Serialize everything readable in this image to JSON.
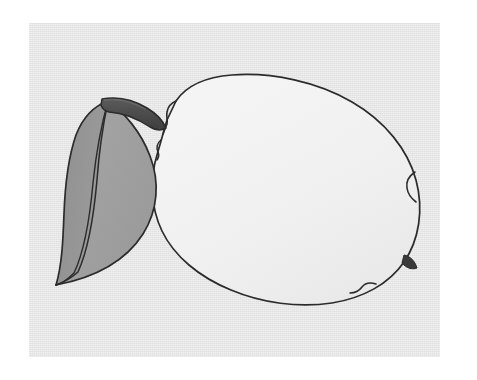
{
  "artwork": {
    "title": "Lemon with leaf",
    "subject": "lemon-fruit-line-drawing",
    "style": "clip-art line drawing, grayscale",
    "caption": ""
  },
  "canvas": {
    "page_background": "#ffffff",
    "card_background": "#e5e5e5",
    "card_left": 29,
    "card_top": 23,
    "card_width": 411,
    "card_height": 334
  },
  "palette": {
    "outline": "#2b2b2b",
    "fruit_fill": "#f1f1f1",
    "fruit_shade": "#ebebeb",
    "leaf_left_fill": "#959595",
    "leaf_right_fill": "#a2a2a2",
    "leaf_midrib": "#8e8e8e",
    "stem_fill": "#4d4d4d",
    "stem_highlight": "#6b6b6b",
    "blossom_nub": "#3a3a3a"
  },
  "elements": {
    "fruit": {
      "label": "lemon body",
      "bounds": {
        "x": 150,
        "y": 73,
        "width": 272,
        "height": 234
      }
    },
    "leaf": {
      "label": "leaf",
      "bounds": {
        "x": 51,
        "y": 100,
        "width": 115,
        "height": 186
      },
      "halves": [
        "leaf-left-half",
        "leaf-right-half"
      ],
      "midrib": "leaf-midrib-vein"
    },
    "stem": {
      "label": "stem",
      "bounds": {
        "x": 100,
        "y": 96,
        "width": 66,
        "height": 32
      }
    },
    "blossom_tip": {
      "label": "blossom end nub",
      "position": {
        "x": 414,
        "y": 267
      }
    }
  },
  "geometry": {
    "fruit_outline_path": "M 176,101 C 186,86 206,77 232,75 C 272,72 318,82 352,102 C 385,121 408,150 416,180 C 424,210 419,240 404,262 C 389,284 363,298 332,303 C 298,308 262,303 231,290 C 199,277 174,256 162,231 C 150,206 150,178 157,155 L 163,134 L 167,120 Z",
    "fruit_left_notch_path": "M 176,101 C 171,103 168,107 167,112 C 166,117 168,121 167,124 L 163,134",
    "fruit_left_dimple_path": "M 161,140 C 157,143 156,148 158,152 C 160,156 158,158 157,160",
    "fruit_right_notch_path": "M 415,172 C 409,176 406,182 407,188 C 408,195 412,199 416,202",
    "fruit_bottom_notch_path": "M 376,284 C 370,282 365,283 362,287 C 359,291 355,293 350,293",
    "blossom_nub_path": "M 404,255 C 410,256 415,261 417,268 C 412,270 406,268 402,263 Z",
    "leaf_outline_path": "M 108,101 C 124,112 141,132 150,156 C 160,182 158,210 143,234 C 127,259 98,277 56,285 C 62,265 63,240 64,214 C 65,186 68,158 76,135 C 83,117 94,106 108,101 Z",
    "leaf_midrib_path": "M 108,101 C 103,125 99,152 97,180 C 94,214 89,248 78,272 C 70,279 62,283 56,285",
    "leaf_midrib_path2": "M 108,101 C 101,126 96,154 93,183 C 90,216 85,250 74,273 C 67,280 61,284 56,285",
    "leaf_left_half_path": "M 108,101 C 94,106 83,117 76,135 C 68,158 65,186 64,214 C 63,240 62,265 56,285 C 62,283 70,279 78,272 C 89,248 94,214 97,180 C 99,152 103,125 108,101 Z",
    "leaf_right_half_path": "M 108,101 C 124,112 141,132 150,156 C 160,182 158,210 143,234 C 127,259 98,277 56,285 C 61,284 67,280 74,273 C 85,250 90,216 93,183 C 96,154 101,126 108,101 Z",
    "stem_path": "M 102,99 C 118,96 134,100 147,108 C 157,114 163,121 166,128 C 161,131 155,130 150,127 C 138,119 124,113 109,112 C 105,111 102,108 101,105 Z",
    "stem_highlight_path": "M 104,100 C 119,98 133,102 145,109"
  }
}
